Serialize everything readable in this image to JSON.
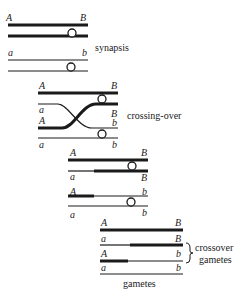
{
  "stages": {
    "synapsis": {
      "caption": "synapsis",
      "labels": {
        "top_left": "A",
        "top_right": "B",
        "bottom_left": "a",
        "bottom_right": "b"
      }
    },
    "crossing_over": {
      "caption": "crossing-over",
      "labels": {
        "r1_left": "A",
        "r1_right": "B",
        "r2_left": "a",
        "r2_right": "B",
        "r3_left": "A",
        "r3_right": "b",
        "r4_left": "a",
        "r4_right": "b"
      }
    },
    "separation": {
      "labels": {
        "r1_left": "A",
        "r1_right": "B",
        "r2_left": "a",
        "r2_right": "B",
        "r3_left": "A",
        "r3_right": "b",
        "r4_left": "a",
        "r4_right": "b"
      }
    },
    "gametes": {
      "caption": "gametes",
      "crossover_caption_line1": "crossover",
      "crossover_caption_line2": "gametes",
      "labels": {
        "r1_left": "A",
        "r1_right": "B",
        "r2_left": "a",
        "r2_right": "B",
        "r3_left": "A",
        "r3_right": "b",
        "r4_left": "a",
        "r4_right": "b"
      }
    }
  }
}
